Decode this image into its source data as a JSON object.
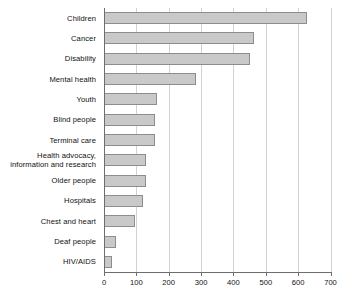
{
  "chart_data": {
    "type": "bar",
    "orientation": "horizontal",
    "title": "",
    "subtitle": "",
    "xlabel": "",
    "ylabel": "",
    "categories": [
      "Children",
      "Cancer",
      "Disability",
      "Mental health",
      "Youth",
      "Blind people",
      "Terminal care",
      "Health advocacy,\ninformation and research",
      "Older people",
      "Hospitals",
      "Chest and heart",
      "Deaf people",
      "HIV/AIDS"
    ],
    "values": [
      628,
      464,
      452,
      285,
      164,
      158,
      158,
      130,
      130,
      121,
      96,
      37,
      25
    ],
    "xlim": [
      0,
      700
    ],
    "xticks": [
      0,
      100,
      200,
      300,
      400,
      500,
      600,
      700
    ],
    "xtick_labels": [
      "0",
      "100",
      "200",
      "300",
      "400",
      "500",
      "600",
      "700"
    ],
    "grid": true,
    "grid_axis": "x",
    "legend": false,
    "legend_position": "none",
    "bar_color": "#c9c9c9",
    "bar_border_color": "#8d8d8d",
    "gridline_color": "#d2d2d2",
    "axis_color": "#6e6e6e",
    "background_color": "#ffffff"
  }
}
